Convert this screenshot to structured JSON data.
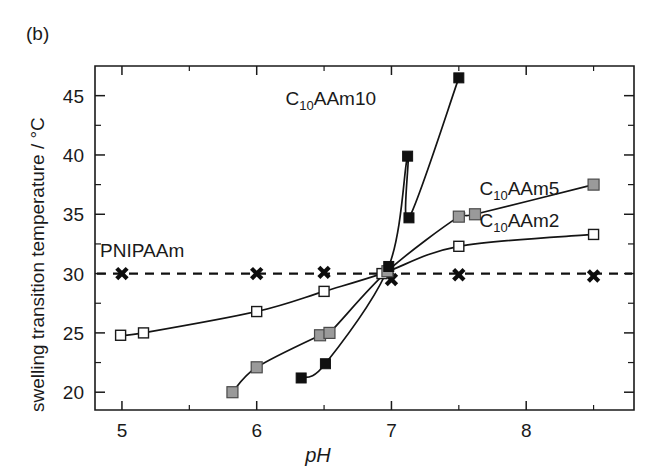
{
  "figure": {
    "panel_label": "(b)",
    "background_color": "#ffffff"
  },
  "chart_data": {
    "type": "scatter",
    "title": "",
    "subtitle": "",
    "xlabel": "pH",
    "ylabel": "swelling transition temperature / °C",
    "xlim": [
      4.8,
      8.8
    ],
    "ylim": [
      18.5,
      47.5
    ],
    "xticks": [
      5,
      6,
      7,
      8
    ],
    "xtick_labels": [
      "5",
      "6",
      "7",
      "8"
    ],
    "yticks": [
      20,
      25,
      30,
      35,
      40,
      45
    ],
    "ytick_labels": [
      "20",
      "25",
      "30",
      "35",
      "40",
      "45"
    ],
    "x_minor_ticks": [
      5.5,
      6.5,
      7.5,
      8.5
    ],
    "y_minor_ticks": [
      22.5,
      27.5,
      32.5,
      37.5,
      42.5
    ],
    "grid": false,
    "legend_position": "inline-annotations",
    "annotations": [
      {
        "text": "PNIPAAm",
        "x": 5.15,
        "y": 31.4,
        "name": "pnipaam-label"
      },
      {
        "text": "C",
        "sub": "10",
        "text2": "AAm10",
        "x": 6.55,
        "y": 44.2,
        "name": "c10aam10-label"
      },
      {
        "text": "C",
        "sub": "10",
        "text2": "AAm5",
        "x": 7.95,
        "y": 36.6,
        "name": "c10aam5-label"
      },
      {
        "text": "C",
        "sub": "10",
        "text2": "AAm2",
        "x": 7.95,
        "y": 33.9,
        "name": "c10aam2-label"
      }
    ],
    "series": [
      {
        "name": "PNIPAAm",
        "marker": "cross",
        "marker_color": "#0d0d0d",
        "line_style": "dashed",
        "line_color": "#111111",
        "points": [
          {
            "x": 5.0,
            "y": 30.0
          },
          {
            "x": 6.0,
            "y": 30.0
          },
          {
            "x": 6.5,
            "y": 30.1
          },
          {
            "x": 7.0,
            "y": 29.5
          },
          {
            "x": 7.5,
            "y": 29.9
          },
          {
            "x": 8.5,
            "y": 29.8
          }
        ],
        "reference_level": 30.0
      },
      {
        "name": "C10AAm2",
        "marker": "open-square",
        "marker_color": "#ffffff",
        "line_style": "solid",
        "line_color": "#141414",
        "points": [
          {
            "x": 4.99,
            "y": 24.8
          },
          {
            "x": 5.16,
            "y": 25.0
          },
          {
            "x": 6.0,
            "y": 26.8
          },
          {
            "x": 6.5,
            "y": 28.5
          },
          {
            "x": 6.93,
            "y": 30.0
          },
          {
            "x": 7.5,
            "y": 32.3
          },
          {
            "x": 8.5,
            "y": 33.3
          }
        ]
      },
      {
        "name": "C10AAm5",
        "marker": "gray-square",
        "marker_color": "#9a9a9a",
        "line_style": "solid",
        "line_color": "#141414",
        "points": [
          {
            "x": 5.82,
            "y": 20.0
          },
          {
            "x": 6.0,
            "y": 22.1
          },
          {
            "x": 6.47,
            "y": 24.8
          },
          {
            "x": 6.54,
            "y": 25.0
          },
          {
            "x": 6.97,
            "y": 30.2
          },
          {
            "x": 7.5,
            "y": 34.8
          },
          {
            "x": 7.62,
            "y": 35.0
          },
          {
            "x": 8.5,
            "y": 37.5
          }
        ]
      },
      {
        "name": "C10AAm10",
        "marker": "filled-square",
        "marker_color": "#101010",
        "line_style": "solid",
        "line_color": "#141414",
        "points": [
          {
            "x": 6.33,
            "y": 21.2
          },
          {
            "x": 6.51,
            "y": 22.4
          },
          {
            "x": 6.98,
            "y": 30.6
          },
          {
            "x": 7.13,
            "y": 34.7
          },
          {
            "x": 7.12,
            "y": 39.9
          },
          {
            "x": 7.5,
            "y": 46.5
          }
        ]
      }
    ]
  }
}
